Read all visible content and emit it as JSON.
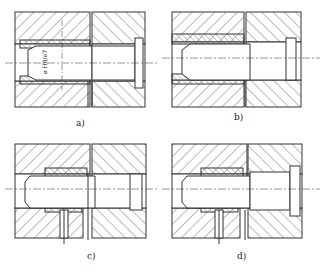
{
  "figure": {
    "panels": [
      {
        "id": "a",
        "label": "a)",
        "annotation": "ø H8/e7"
      },
      {
        "id": "b",
        "label": "b)"
      },
      {
        "id": "c",
        "label": "c)"
      },
      {
        "id": "d",
        "label": "d)"
      }
    ]
  },
  "colors": {
    "line": "#333333",
    "background": "#ffffff"
  }
}
